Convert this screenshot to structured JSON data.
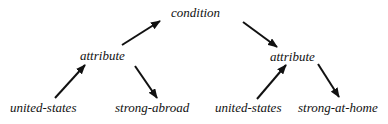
{
  "diagram": {
    "type": "tree",
    "nodes": {
      "root": {
        "label": "condition"
      },
      "left_attribute": {
        "label": "attribute"
      },
      "right_attribute": {
        "label": "attribute"
      },
      "left_leaf_1": {
        "label": "united-states"
      },
      "left_leaf_2": {
        "label": "strong-abroad"
      },
      "right_leaf_1": {
        "label": "united-states"
      },
      "right_leaf_2": {
        "label": "strong-at-home"
      }
    },
    "edges": [
      {
        "from": "left_attribute",
        "to": "root"
      },
      {
        "from": "root",
        "to": "right_attribute"
      },
      {
        "from": "left_leaf_1",
        "to": "left_attribute"
      },
      {
        "from": "left_attribute",
        "to": "left_leaf_2"
      },
      {
        "from": "right_leaf_1",
        "to": "right_attribute"
      },
      {
        "from": "right_attribute",
        "to": "right_leaf_2"
      }
    ],
    "colors": {
      "ink": "#111111",
      "background": "#ffffff"
    }
  }
}
